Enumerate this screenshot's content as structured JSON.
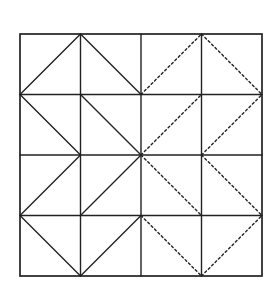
{
  "diagram": {
    "type": "grid-tessellation",
    "rows": 4,
    "cols": 4,
    "origin": [
      20,
      34
    ],
    "cell_size": [
      60.5,
      60.5
    ],
    "colors": {
      "background": "#ffffff",
      "line": "#222222"
    },
    "stroke_width": 1.4,
    "dash_pattern": "2.2 2.6",
    "cells": [
      [
        {
          "diagonal": "/",
          "style": "solid"
        },
        {
          "diagonal": "\\",
          "style": "solid"
        },
        {
          "diagonal": "/",
          "style": "dashed"
        },
        {
          "diagonal": "\\",
          "style": "dashed"
        }
      ],
      [
        {
          "diagonal": "\\",
          "style": "solid"
        },
        {
          "diagonal": "\\",
          "style": "solid"
        },
        {
          "diagonal": "/",
          "style": "dashed"
        },
        {
          "diagonal": "/",
          "style": "dashed"
        }
      ],
      [
        {
          "diagonal": "/",
          "style": "solid"
        },
        {
          "diagonal": "/",
          "style": "solid"
        },
        {
          "diagonal": "\\",
          "style": "dashed"
        },
        {
          "diagonal": "\\",
          "style": "dashed"
        }
      ],
      [
        {
          "diagonal": "\\",
          "style": "solid"
        },
        {
          "diagonal": "/",
          "style": "solid"
        },
        {
          "diagonal": "\\",
          "style": "dashed"
        },
        {
          "diagonal": "/",
          "style": "dashed"
        }
      ]
    ]
  }
}
